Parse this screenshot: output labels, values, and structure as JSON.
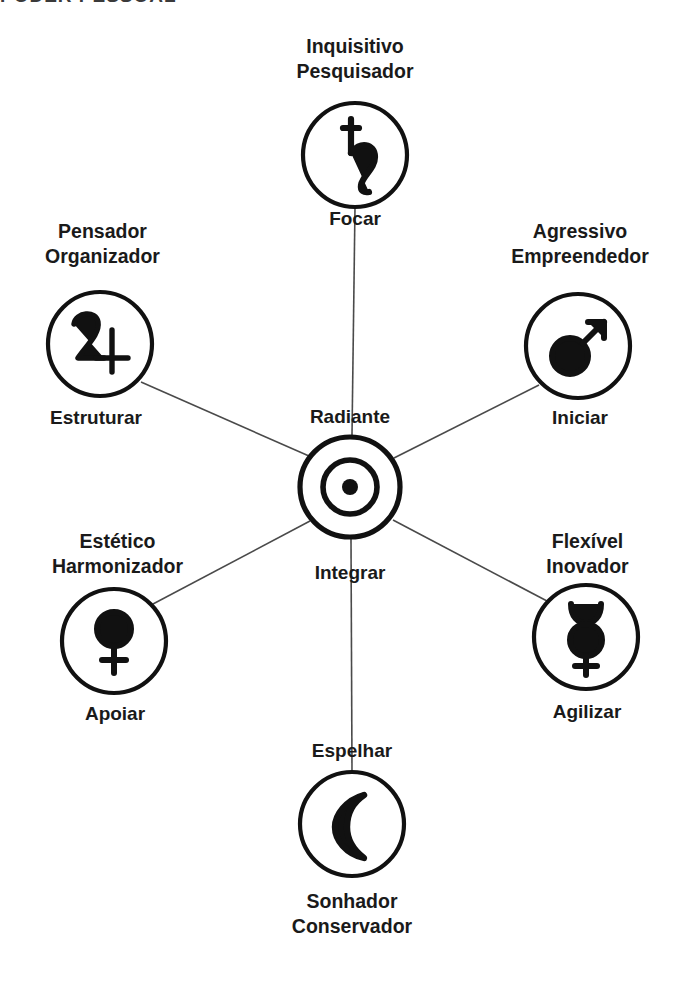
{
  "heading": {
    "text": "PODER PESSOAL",
    "clipped": true
  },
  "diagram": {
    "type": "radial-hub-and-spoke",
    "title_visible_partial": "PODER PESSOAL",
    "language": "pt-BR",
    "hub": {
      "id": "sol",
      "glyph_name": "sun-symbol",
      "glyph": "☉",
      "verb_label": "Radiante",
      "verb_label_secondary": "Integrar",
      "cx": 350,
      "cy": 487,
      "r": 52
    },
    "nodes": [
      {
        "id": "saturno",
        "position": "top",
        "glyph_name": "saturn-symbol",
        "glyph": "♄",
        "archetype_line1": "Inquisitivo",
        "archetype_line2": "Pesquisador",
        "verb": "Focar",
        "cx": 355,
        "cy": 155,
        "r": 52
      },
      {
        "id": "jupiter",
        "position": "upper-left",
        "glyph_name": "jupiter-symbol",
        "glyph": "♃",
        "archetype_line1": "Pensador",
        "archetype_line2": "Organizador",
        "verb": "Estruturar",
        "cx": 100,
        "cy": 344,
        "r": 52
      },
      {
        "id": "marte",
        "position": "upper-right",
        "glyph_name": "mars-symbol",
        "glyph": "♂",
        "archetype_line1": "Agressivo",
        "archetype_line2": "Empreendedor",
        "verb": "Iniciar",
        "cx": 578,
        "cy": 346,
        "r": 52
      },
      {
        "id": "venus",
        "position": "lower-left",
        "glyph_name": "venus-symbol",
        "glyph": "♀",
        "archetype_line1": "Estético",
        "archetype_line2": "Harmonizador",
        "verb": "Apoiar",
        "cx": 114,
        "cy": 641,
        "r": 52
      },
      {
        "id": "mercurio",
        "position": "lower-right",
        "glyph_name": "mercury-symbol",
        "glyph": "☿",
        "archetype_line1": "Flexível",
        "archetype_line2": "Inovador",
        "verb": "Agilizar",
        "cx": 586,
        "cy": 637,
        "r": 52
      },
      {
        "id": "lua",
        "position": "bottom",
        "glyph_name": "moon-crescent-symbol",
        "glyph": "☾",
        "archetype_line1": "Sonhador",
        "archetype_line2": "Conservador",
        "verb": "Espelhar",
        "cx": 352,
        "cy": 824,
        "r": 52
      }
    ],
    "colors": {
      "ink": "#111111",
      "spoke": "#4a4a4a",
      "background": "#ffffff",
      "heading": "#3a3a3a"
    }
  }
}
